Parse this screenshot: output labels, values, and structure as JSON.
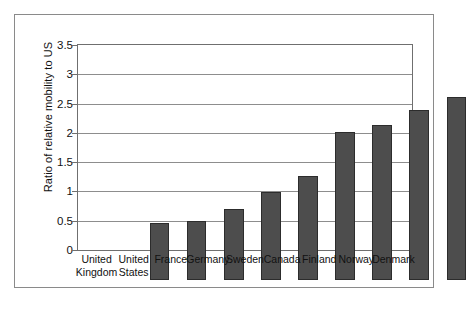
{
  "chart_data": {
    "type": "bar",
    "title": "",
    "xlabel": "",
    "ylabel": "Ratio of relative mobility to US",
    "categories": [
      "United Kingdom",
      "United States",
      "France",
      "Germany",
      "Sweden",
      "Canada",
      "Finland",
      "Norway",
      "Denmark"
    ],
    "category_lines": [
      [
        "United",
        "Kingdom"
      ],
      [
        "United",
        "States"
      ],
      [
        "France"
      ],
      [
        "Germany"
      ],
      [
        "Sweden"
      ],
      [
        "Canada"
      ],
      [
        "Finland"
      ],
      [
        "Norway"
      ],
      [
        "Denmark"
      ]
    ],
    "values": [
      0.97,
      1.0,
      1.22,
      1.5,
      1.77,
      2.52,
      2.65,
      2.9,
      3.13
    ],
    "ylim": [
      0,
      3.5
    ],
    "ytick_labels": [
      "0",
      "0.5",
      "1",
      "1.5",
      "2",
      "2.5",
      "3",
      "3.5"
    ],
    "ytick_values": [
      0,
      0.5,
      1,
      1.5,
      2,
      2.5,
      3,
      3.5
    ],
    "grid": true,
    "legend": false,
    "bar_color": "#4d4d4d",
    "bar_edge_color": "#2c2c2c",
    "gridline_color": "#8d8d8d",
    "axis_color": "#6f6f6f",
    "frame_color": "#8a8a8a",
    "background_color": "#ffffff"
  }
}
